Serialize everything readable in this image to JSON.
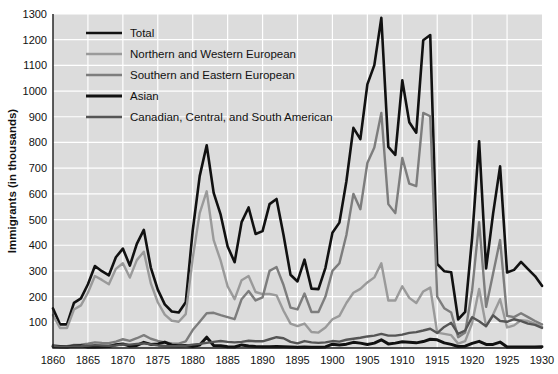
{
  "figure": {
    "width": 558,
    "height": 374,
    "background": "#ffffff",
    "plot_background": "#dcdcdc",
    "gridline_color": "#ffffff",
    "axis_color": "#1a1a1a"
  },
  "axes": {
    "ylabel": "Immigrants (in thousands)",
    "xlabel": "",
    "y_ticks": [
      "100",
      "200",
      "300",
      "400",
      "500",
      "600",
      "700",
      "800",
      "900",
      "1000",
      "1100",
      "1200",
      "1300"
    ],
    "x_ticks": [
      "1860",
      "1865",
      "1870",
      "1875",
      "1880",
      "1885",
      "1890",
      "1895",
      "1900",
      "1905",
      "1910",
      "1915",
      "1920",
      "1925",
      "1930"
    ]
  },
  "legend": {
    "position": "top-left",
    "entries": [
      {
        "label": "Total",
        "color": "#111111",
        "width": 2.6
      },
      {
        "label": "Northern and Western European",
        "color": "#9a9a9a",
        "width": 2.4
      },
      {
        "label": "Southern and Eastern European",
        "color": "#7d7d7d",
        "width": 2.4
      },
      {
        "label": "Asian",
        "color": "#111111",
        "width": 3.0
      },
      {
        "label": "Canadian, Central, and South American",
        "color": "#555555",
        "width": 2.4
      }
    ]
  },
  "chart_data": {
    "type": "line",
    "title": "",
    "xlabel": "",
    "ylabel": "Immigrants (in thousands)",
    "xlim": [
      1860,
      1930
    ],
    "ylim": [
      0,
      1300
    ],
    "y_tick_step": 100,
    "x_tick_step": 5,
    "grid": true,
    "legend_position": "top-left",
    "x": [
      1860,
      1861,
      1862,
      1863,
      1864,
      1865,
      1866,
      1867,
      1868,
      1869,
      1870,
      1871,
      1872,
      1873,
      1874,
      1875,
      1876,
      1877,
      1878,
      1879,
      1880,
      1881,
      1882,
      1883,
      1884,
      1885,
      1886,
      1887,
      1888,
      1889,
      1890,
      1891,
      1892,
      1893,
      1894,
      1895,
      1896,
      1897,
      1898,
      1899,
      1900,
      1901,
      1902,
      1903,
      1904,
      1905,
      1906,
      1907,
      1908,
      1909,
      1910,
      1911,
      1912,
      1913,
      1914,
      1915,
      1916,
      1917,
      1918,
      1919,
      1920,
      1921,
      1922,
      1923,
      1924,
      1925,
      1926,
      1927,
      1928,
      1929,
      1930
    ],
    "series": [
      {
        "name": "Total",
        "color": "#111111",
        "values": [
          154,
          92,
          92,
          176,
          193,
          248,
          319,
          299,
          283,
          353,
          387,
          321,
          405,
          460,
          313,
          227,
          170,
          142,
          138,
          178,
          457,
          669,
          789,
          604,
          519,
          395,
          334,
          490,
          547,
          444,
          455,
          560,
          580,
          440,
          285,
          259,
          344,
          231,
          229,
          312,
          449,
          488,
          649,
          857,
          813,
          1026,
          1101,
          1285,
          783,
          752,
          1042,
          879,
          838,
          1198,
          1218,
          327,
          299,
          295,
          111,
          141,
          430,
          805,
          310,
          523,
          707,
          294,
          304,
          335,
          307,
          280,
          242
        ]
      },
      {
        "name": "Northern and Western European",
        "color": "#9a9a9a",
        "values": [
          128,
          78,
          78,
          150,
          166,
          215,
          280,
          265,
          248,
          308,
          330,
          274,
          342,
          375,
          252,
          178,
          130,
          106,
          102,
          132,
          349,
          525,
          610,
          420,
          340,
          240,
          190,
          264,
          280,
          218,
          210,
          210,
          205,
          145,
          95,
          85,
          95,
          62,
          60,
          80,
          112,
          125,
          175,
          215,
          230,
          255,
          275,
          330,
          185,
          185,
          240,
          195,
          175,
          220,
          235,
          60,
          55,
          50,
          17,
          27,
          97,
          230,
          85,
          130,
          190,
          80,
          88,
          108,
          105,
          95,
          82
        ]
      },
      {
        "name": "Southern and Eastern European",
        "color": "#7d7d7d",
        "values": [
          12,
          7,
          7,
          12,
          13,
          17,
          22,
          20,
          19,
          25,
          34,
          28,
          38,
          50,
          36,
          28,
          22,
          18,
          17,
          26,
          70,
          102,
          135,
          137,
          128,
          120,
          112,
          190,
          222,
          185,
          197,
          300,
          315,
          245,
          157,
          150,
          212,
          140,
          140,
          200,
          300,
          330,
          440,
          600,
          540,
          720,
          780,
          915,
          560,
          525,
          740,
          640,
          630,
          915,
          902,
          200,
          155,
          138,
          42,
          60,
          225,
          490,
          160,
          290,
          420,
          125,
          120,
          135,
          120,
          105,
          92
        ]
      },
      {
        "name": "Asian",
        "color": "#111111",
        "values": [
          6,
          5,
          4,
          8,
          9,
          4,
          4,
          5,
          6,
          13,
          16,
          8,
          10,
          22,
          14,
          16,
          23,
          11,
          9,
          10,
          6,
          12,
          42,
          10,
          9,
          5,
          4,
          12,
          8,
          6,
          5,
          5,
          6,
          5,
          4,
          3,
          4,
          3,
          3,
          4,
          15,
          12,
          15,
          22,
          19,
          14,
          19,
          32,
          16,
          19,
          24,
          22,
          20,
          25,
          34,
          32,
          20,
          14,
          6,
          7,
          18,
          26,
          14,
          14,
          23,
          4,
          4,
          4,
          4,
          4,
          5
        ]
      },
      {
        "name": "Canadian, Central, and South American",
        "color": "#555555",
        "values": [
          8,
          4,
          4,
          6,
          7,
          9,
          11,
          10,
          9,
          10,
          14,
          13,
          16,
          18,
          14,
          10,
          8,
          7,
          7,
          9,
          13,
          16,
          20,
          24,
          27,
          24,
          22,
          24,
          28,
          26,
          26,
          34,
          42,
          38,
          24,
          18,
          27,
          22,
          20,
          22,
          27,
          25,
          32,
          36,
          40,
          45,
          48,
          55,
          48,
          48,
          52,
          59,
          62,
          68,
          75,
          58,
          82,
          98,
          55,
          68,
          120,
          104,
          85,
          127,
          105,
          102,
          112,
          105,
          95,
          90,
          78
        ]
      }
    ]
  }
}
